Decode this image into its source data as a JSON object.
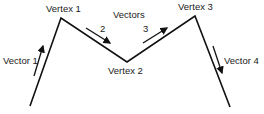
{
  "diagram": {
    "vertices": [
      {
        "label": "Vertex 1"
      },
      {
        "label": "Vertex 2"
      },
      {
        "label": "Vertex 3"
      }
    ],
    "title": "Vectors",
    "vectors": [
      {
        "label": "Vector 1"
      },
      {
        "label": "2"
      },
      {
        "label": "3"
      },
      {
        "label": "Vector 4"
      }
    ],
    "colors": {
      "line": "#111111",
      "background": "#ffffff"
    }
  }
}
